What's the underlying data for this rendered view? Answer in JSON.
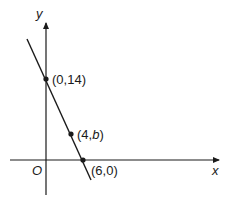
{
  "diagram": {
    "type": "coordinate-graph",
    "axes": {
      "x_label": "x",
      "y_label": "y",
      "origin_label": "O"
    },
    "line": {
      "description": "straight line through (0,14) and (6,0)",
      "points": [
        {
          "label_open": "(0,",
          "label_var": "",
          "label_rest": "14)",
          "x": 0,
          "y": 14
        },
        {
          "label_open": "(4,",
          "label_var": "b",
          "label_rest": ")",
          "x": 4,
          "y": "b"
        },
        {
          "label_open": "(6,",
          "label_var": "",
          "label_rest": "0)",
          "x": 6,
          "y": 0
        }
      ]
    },
    "colors": {
      "stroke": "#1a1a1a",
      "background": "#ffffff"
    }
  }
}
